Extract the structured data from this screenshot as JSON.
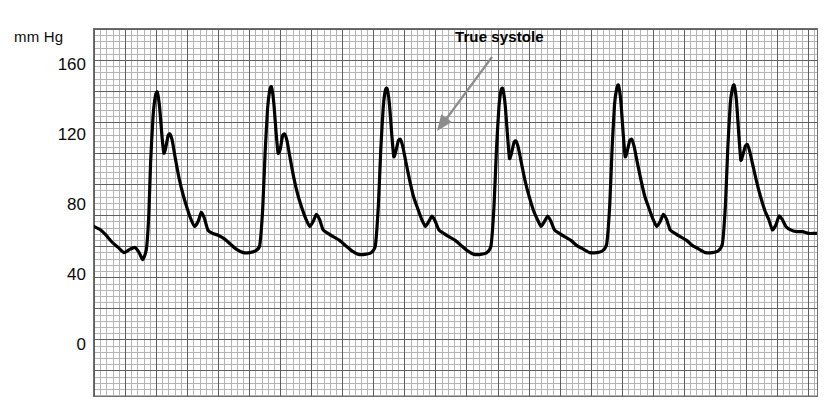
{
  "axis": {
    "unit_label": "mm Hg",
    "y_ticks": [
      {
        "value": 160,
        "label": "160"
      },
      {
        "value": 120,
        "label": "120"
      },
      {
        "value": 80,
        "label": "80"
      },
      {
        "value": 40,
        "label": "40"
      },
      {
        "value": 0,
        "label": "0"
      }
    ]
  },
  "annotation": {
    "label": "True systole",
    "arrow_color": "#8c8c8c"
  },
  "chart_data": {
    "type": "line",
    "title": "",
    "subtitle": "",
    "xlabel": "",
    "ylabel": "mm Hg",
    "ylim": [
      0,
      180
    ],
    "xlim": [
      0,
      6
    ],
    "grid": true,
    "grid_minor_mm_hg": 3.6,
    "grid_major_mm_hg": 18,
    "legend": "none",
    "trace_color": "#000000",
    "trace_width_px": 3.2,
    "annotations": [
      {
        "text": "True systole",
        "points_to_beat": 3,
        "points_to_feature": "first-systolic-peak",
        "target_value_mm_hg": 118,
        "arrow_color": "#8c8c8c"
      }
    ],
    "beats": [
      {
        "index": 1,
        "systolic_peak_1": 145,
        "systolic_peak_2": 121,
        "notch": 109,
        "reflected_wave": 76,
        "diastolic": 52
      },
      {
        "index": 2,
        "systolic_peak_1": 148,
        "systolic_peak_2": 121,
        "notch": 108,
        "reflected_wave": 75,
        "diastolic": 52
      },
      {
        "index": 3,
        "systolic_peak_1": 147,
        "systolic_peak_2": 118,
        "notch": 107,
        "reflected_wave": 74,
        "diastolic": 52
      },
      {
        "index": 4,
        "systolic_peak_1": 147,
        "systolic_peak_2": 117,
        "notch": 106,
        "reflected_wave": 74,
        "diastolic": 53
      },
      {
        "index": 5,
        "systolic_peak_1": 149,
        "systolic_peak_2": 118,
        "notch": 108,
        "reflected_wave": 75,
        "diastolic": 53
      },
      {
        "index": 6,
        "systolic_peak_1": 149,
        "systolic_peak_2": 115,
        "notch": 106,
        "reflected_wave": 75,
        "diastolic": 54
      }
    ],
    "points": [
      [
        0.0,
        68
      ],
      [
        0.055,
        66
      ],
      [
        0.1,
        63
      ],
      [
        0.15,
        59
      ],
      [
        0.2,
        56
      ],
      [
        0.25,
        53
      ],
      [
        0.3,
        55
      ],
      [
        0.34,
        56
      ],
      [
        0.375,
        53
      ],
      [
        0.405,
        49
      ],
      [
        0.435,
        55
      ],
      [
        0.455,
        75
      ],
      [
        0.47,
        105
      ],
      [
        0.49,
        131
      ],
      [
        0.51,
        143
      ],
      [
        0.525,
        145
      ],
      [
        0.545,
        136
      ],
      [
        0.565,
        119
      ],
      [
        0.58,
        110
      ],
      [
        0.595,
        113
      ],
      [
        0.615,
        120
      ],
      [
        0.63,
        121
      ],
      [
        0.65,
        117
      ],
      [
        0.675,
        107
      ],
      [
        0.705,
        96
      ],
      [
        0.74,
        86
      ],
      [
        0.775,
        78
      ],
      [
        0.805,
        72
      ],
      [
        0.835,
        68
      ],
      [
        0.865,
        71
      ],
      [
        0.89,
        76
      ],
      [
        0.915,
        73
      ],
      [
        0.945,
        66
      ],
      [
        0.985,
        64
      ],
      [
        1.03,
        63
      ],
      [
        1.08,
        61
      ],
      [
        1.13,
        58
      ],
      [
        1.18,
        55
      ],
      [
        1.24,
        53
      ],
      [
        1.29,
        53
      ],
      [
        1.34,
        54
      ],
      [
        1.375,
        57
      ],
      [
        1.4,
        78
      ],
      [
        1.42,
        110
      ],
      [
        1.44,
        135
      ],
      [
        1.458,
        146
      ],
      [
        1.472,
        148
      ],
      [
        1.492,
        139
      ],
      [
        1.512,
        121
      ],
      [
        1.528,
        110
      ],
      [
        1.545,
        112
      ],
      [
        1.565,
        120
      ],
      [
        1.582,
        121
      ],
      [
        1.602,
        117
      ],
      [
        1.628,
        107
      ],
      [
        1.658,
        96
      ],
      [
        1.692,
        86
      ],
      [
        1.728,
        78
      ],
      [
        1.76,
        72
      ],
      [
        1.79,
        68
      ],
      [
        1.82,
        71
      ],
      [
        1.845,
        75
      ],
      [
        1.872,
        72
      ],
      [
        1.902,
        66
      ],
      [
        1.942,
        64
      ],
      [
        1.988,
        62
      ],
      [
        2.038,
        60
      ],
      [
        2.088,
        57
      ],
      [
        2.14,
        54
      ],
      [
        2.195,
        52
      ],
      [
        2.25,
        52
      ],
      [
        2.3,
        53
      ],
      [
        2.335,
        57
      ],
      [
        2.36,
        80
      ],
      [
        2.38,
        112
      ],
      [
        2.4,
        136
      ],
      [
        2.418,
        146
      ],
      [
        2.432,
        147
      ],
      [
        2.452,
        138
      ],
      [
        2.472,
        120
      ],
      [
        2.488,
        108
      ],
      [
        2.505,
        111
      ],
      [
        2.525,
        117
      ],
      [
        2.542,
        118
      ],
      [
        2.562,
        114
      ],
      [
        2.588,
        105
      ],
      [
        2.618,
        95
      ],
      [
        2.652,
        85
      ],
      [
        2.688,
        78
      ],
      [
        2.72,
        72
      ],
      [
        2.75,
        68
      ],
      [
        2.78,
        71
      ],
      [
        2.805,
        74
      ],
      [
        2.832,
        71
      ],
      [
        2.862,
        66
      ],
      [
        2.902,
        64
      ],
      [
        2.948,
        62
      ],
      [
        2.998,
        60
      ],
      [
        3.048,
        57
      ],
      [
        3.1,
        54
      ],
      [
        3.155,
        52
      ],
      [
        3.21,
        52
      ],
      [
        3.26,
        53
      ],
      [
        3.295,
        57
      ],
      [
        3.32,
        80
      ],
      [
        3.34,
        112
      ],
      [
        3.36,
        136
      ],
      [
        3.378,
        146
      ],
      [
        3.392,
        147
      ],
      [
        3.412,
        138
      ],
      [
        3.432,
        120
      ],
      [
        3.448,
        107
      ],
      [
        3.465,
        110
      ],
      [
        3.485,
        116
      ],
      [
        3.502,
        117
      ],
      [
        3.522,
        113
      ],
      [
        3.548,
        104
      ],
      [
        3.578,
        94
      ],
      [
        3.612,
        85
      ],
      [
        3.648,
        77
      ],
      [
        3.68,
        72
      ],
      [
        3.71,
        68
      ],
      [
        3.74,
        71
      ],
      [
        3.765,
        74
      ],
      [
        3.792,
        71
      ],
      [
        3.822,
        66
      ],
      [
        3.862,
        64
      ],
      [
        3.908,
        62
      ],
      [
        3.958,
        60
      ],
      [
        4.008,
        57
      ],
      [
        4.06,
        55
      ],
      [
        4.115,
        53
      ],
      [
        4.17,
        53
      ],
      [
        4.22,
        54
      ],
      [
        4.255,
        58
      ],
      [
        4.28,
        80
      ],
      [
        4.3,
        113
      ],
      [
        4.32,
        138
      ],
      [
        4.338,
        147
      ],
      [
        4.352,
        149
      ],
      [
        4.372,
        140
      ],
      [
        4.392,
        121
      ],
      [
        4.408,
        108
      ],
      [
        4.425,
        111
      ],
      [
        4.445,
        117
      ],
      [
        4.462,
        118
      ],
      [
        4.482,
        114
      ],
      [
        4.508,
        105
      ],
      [
        4.538,
        95
      ],
      [
        4.572,
        85
      ],
      [
        4.608,
        78
      ],
      [
        4.64,
        72
      ],
      [
        4.67,
        68
      ],
      [
        4.7,
        71
      ],
      [
        4.725,
        75
      ],
      [
        4.752,
        72
      ],
      [
        4.782,
        66
      ],
      [
        4.822,
        64
      ],
      [
        4.868,
        62
      ],
      [
        4.918,
        60
      ],
      [
        4.968,
        57
      ],
      [
        5.02,
        55
      ],
      [
        5.075,
        53
      ],
      [
        5.13,
        53
      ],
      [
        5.18,
        54
      ],
      [
        5.215,
        58
      ],
      [
        5.24,
        80
      ],
      [
        5.26,
        113
      ],
      [
        5.28,
        138
      ],
      [
        5.298,
        147
      ],
      [
        5.312,
        149
      ],
      [
        5.332,
        140
      ],
      [
        5.352,
        120
      ],
      [
        5.368,
        106
      ],
      [
        5.385,
        109
      ],
      [
        5.405,
        114
      ],
      [
        5.422,
        115
      ],
      [
        5.442,
        111
      ],
      [
        5.468,
        103
      ],
      [
        5.498,
        94
      ],
      [
        5.532,
        85
      ],
      [
        5.568,
        77
      ],
      [
        5.6,
        72
      ],
      [
        5.63,
        66
      ],
      [
        5.66,
        69
      ],
      [
        5.685,
        74
      ],
      [
        5.712,
        72
      ],
      [
        5.742,
        68
      ],
      [
        5.782,
        66
      ],
      [
        5.83,
        65
      ],
      [
        5.88,
        65
      ],
      [
        5.93,
        64
      ],
      [
        5.98,
        64
      ],
      [
        6.0,
        64
      ]
    ]
  }
}
